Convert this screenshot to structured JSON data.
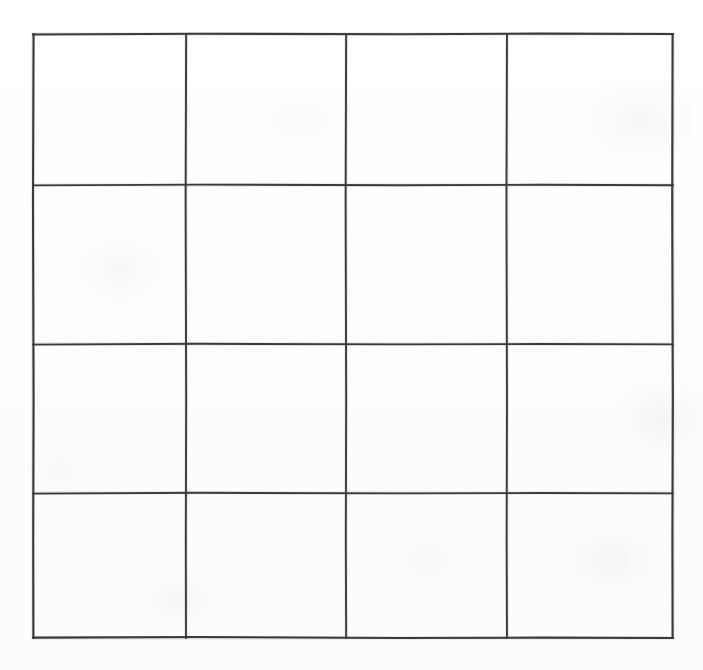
{
  "figure": {
    "background_color": "#fefefe",
    "line_color": "#3b3b3d",
    "line_width_px": 2,
    "rows": 4,
    "columns": 4,
    "cell_count": 16,
    "bounds": {
      "left": 33,
      "top": 34,
      "right": 673,
      "bottom": 638,
      "width": 640,
      "height": 604
    },
    "vertical_line_x": [
      33,
      186,
      346,
      507,
      673
    ],
    "horizontal_line_y": [
      34,
      185,
      344,
      493,
      638
    ],
    "column_widths": [
      153,
      160,
      161,
      166
    ],
    "row_heights": [
      151,
      159,
      149,
      145
    ],
    "cells": [
      {
        "row": 1,
        "column": 1,
        "label": "",
        "x": 33,
        "y": 34,
        "width": 153,
        "height": 151
      },
      {
        "row": 1,
        "column": 2,
        "label": "",
        "x": 186,
        "y": 34,
        "width": 160,
        "height": 151
      },
      {
        "row": 1,
        "column": 3,
        "label": "",
        "x": 346,
        "y": 34,
        "width": 161,
        "height": 151
      },
      {
        "row": 1,
        "column": 4,
        "label": "",
        "x": 507,
        "y": 34,
        "width": 166,
        "height": 151
      },
      {
        "row": 2,
        "column": 1,
        "label": "",
        "x": 33,
        "y": 185,
        "width": 153,
        "height": 159
      },
      {
        "row": 2,
        "column": 2,
        "label": "",
        "x": 186,
        "y": 185,
        "width": 160,
        "height": 159
      },
      {
        "row": 2,
        "column": 3,
        "label": "",
        "x": 346,
        "y": 185,
        "width": 161,
        "height": 159
      },
      {
        "row": 2,
        "column": 4,
        "label": "",
        "x": 507,
        "y": 185,
        "width": 166,
        "height": 159
      },
      {
        "row": 3,
        "column": 1,
        "label": "",
        "x": 33,
        "y": 344,
        "width": 153,
        "height": 149
      },
      {
        "row": 3,
        "column": 2,
        "label": "",
        "x": 186,
        "y": 344,
        "width": 160,
        "height": 149
      },
      {
        "row": 3,
        "column": 3,
        "label": "",
        "x": 346,
        "y": 344,
        "width": 161,
        "height": 149
      },
      {
        "row": 3,
        "column": 4,
        "label": "",
        "x": 507,
        "y": 344,
        "width": 166,
        "height": 149
      },
      {
        "row": 4,
        "column": 1,
        "label": "",
        "x": 33,
        "y": 493,
        "width": 153,
        "height": 145
      },
      {
        "row": 4,
        "column": 2,
        "label": "",
        "x": 186,
        "y": 493,
        "width": 160,
        "height": 145
      },
      {
        "row": 4,
        "column": 3,
        "label": "",
        "x": 346,
        "y": 493,
        "width": 161,
        "height": 145
      },
      {
        "row": 4,
        "column": 4,
        "label": "",
        "x": 507,
        "y": 493,
        "width": 166,
        "height": 145
      }
    ]
  }
}
